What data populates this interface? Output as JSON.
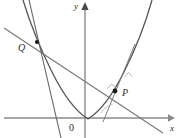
{
  "figure": {
    "background_color": "#ffffff",
    "width": 181,
    "height": 138,
    "axes": {
      "x_axis": {
        "label": "x",
        "label_x": 170,
        "label_y": 131,
        "y_position": 118,
        "x_start": 4,
        "x_end": 168,
        "arrow_tip_x": 175,
        "color": "#8a8a8a",
        "stroke_width": 1.4
      },
      "y_axis": {
        "label": "y",
        "label_x": 74,
        "label_y": 9,
        "x_position": 85,
        "y_start": 138,
        "y_end": 10,
        "arrow_tip_y": 2,
        "color": "#8a8a8a",
        "stroke_width": 1.4
      },
      "origin": {
        "label": "0",
        "label_x": 69,
        "label_y": 131
      }
    },
    "curves": [
      {
        "name": "parabola",
        "path": "M 23 0 Q 34 36 52 72 Q 70 108 88 119 Q 106 108 124 72 Q 142 36 152 0",
        "color": "#555555",
        "stroke_width": 1.3,
        "vertex_x": 88,
        "vertex_y": 119
      }
    ],
    "lines": [
      {
        "name": "secant-line-QP",
        "x1": 4,
        "y1": 28,
        "x2": 163,
        "y2": 133,
        "color": "#777777",
        "stroke_width": 1.1
      },
      {
        "name": "normal-line-through-Q",
        "x1": 29,
        "y1": 0,
        "x2": 61,
        "y2": 138,
        "color": "#666666",
        "stroke_width": 1.1
      },
      {
        "name": "normal-line-through-P",
        "x1": 135,
        "y1": 44,
        "x2": 103,
        "y2": 122,
        "color": "#7a7a7a",
        "stroke_width": 1.0
      }
    ],
    "points": [
      {
        "name": "point-Q",
        "label": "Q",
        "cx": 37,
        "cy": 42,
        "r": 2.1,
        "label_x": 18,
        "label_y": 51,
        "color": "#1a1a1a"
      },
      {
        "name": "point-P",
        "label": "P",
        "cx": 115,
        "cy": 91,
        "r": 2.4,
        "label_x": 122,
        "label_y": 96,
        "color": "#1a1a1a"
      }
    ],
    "markers": [
      {
        "name": "right-angle-marker-at-P",
        "path": "M 107 89 L 111 84 L 115 88",
        "color": "#999999",
        "stroke_width": 0.8
      },
      {
        "name": "right-angle-marker-upper",
        "path": "M 124 77 L 129 73 L 132 78",
        "color": "#aaaaaa",
        "stroke_width": 0.8
      },
      {
        "name": "angle-arc-at-P",
        "path": "M 100 112 A 17 17 0 0 1 113 104",
        "color": "#b0b0b0",
        "stroke_width": 0.8
      }
    ]
  }
}
